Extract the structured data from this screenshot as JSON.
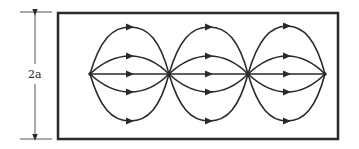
{
  "diagram": {
    "type": "field-line pattern in rectangular waveguide",
    "dimension_label": "2a",
    "cells": 3,
    "nodes_x": [
      90,
      169,
      248,
      325
    ],
    "center_y": 74,
    "lines_per_cell": [
      "outer-top",
      "inner-top",
      "axis",
      "inner-bottom",
      "outer-bottom"
    ],
    "arrow_direction": "right",
    "colors": {
      "stroke": "#2a2a2a",
      "background": "#ffffff"
    }
  }
}
